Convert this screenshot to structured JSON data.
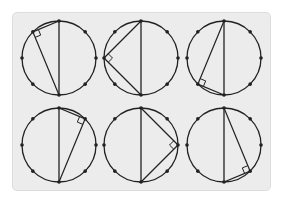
{
  "diagram": {
    "type": "inscribed-right-triangles",
    "colors": {
      "card_bg": "#ececec",
      "card_border": "#dcdcdc",
      "stroke": "#222222",
      "page_bg": "#ffffff"
    },
    "radius": 37,
    "points_per_circle": 8,
    "circles": [
      {
        "id": "circle-1",
        "cx": 59,
        "cy": 58,
        "vertex_angle_deg": 135
      },
      {
        "id": "circle-2",
        "cx": 141,
        "cy": 58,
        "vertex_angle_deg": 180
      },
      {
        "id": "circle-3",
        "cx": 224,
        "cy": 58,
        "vertex_angle_deg": 225
      },
      {
        "id": "circle-4",
        "cx": 59,
        "cy": 145,
        "vertex_angle_deg": 45
      },
      {
        "id": "circle-5",
        "cx": 141,
        "cy": 145,
        "vertex_angle_deg": 0
      },
      {
        "id": "circle-6",
        "cx": 224,
        "cy": 145,
        "vertex_angle_deg": 315
      }
    ]
  }
}
